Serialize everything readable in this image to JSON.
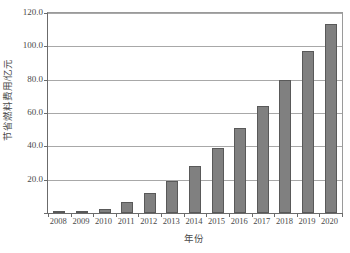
{
  "chart_data": {
    "type": "bar",
    "title": "",
    "xlabel": "年份",
    "ylabel": "节省燃料费用/亿元",
    "categories": [
      "2008",
      "2009",
      "2010",
      "2011",
      "2012",
      "2013",
      "2014",
      "2015",
      "2016",
      "2017",
      "2018",
      "2019",
      "2020"
    ],
    "values": [
      0.2,
      0.6,
      2.5,
      6.5,
      12.0,
      19.0,
      28.0,
      38.8,
      51.0,
      64.0,
      80.0,
      97.0,
      113.5
    ],
    "series": [
      {
        "name": "节省燃料费用",
        "values": [
          0.2,
          0.6,
          2.5,
          6.5,
          12.0,
          19.0,
          28.0,
          38.8,
          51.0,
          64.0,
          80.0,
          97.0,
          113.5
        ]
      }
    ],
    "ylim": [
      0.0,
      120.0
    ],
    "ytick_values": [
      0.0,
      20.0,
      40.0,
      60.0,
      80.0,
      100.0,
      120.0
    ],
    "ytick_labels": [
      "0.0",
      "20.0",
      "40.0",
      "60.0",
      "80.0",
      "100.0",
      "120.0"
    ],
    "ytick_labels_visible": [
      "20.0",
      "40.0",
      "60.0",
      "80.0",
      "100.0",
      "120.0"
    ],
    "grid": true,
    "grid_axis": "y",
    "legend": false,
    "legend_position": "none",
    "bar_color": "#808080",
    "bar_edge_color": "#595959",
    "grid_color": "#a8a8a8",
    "axis_color": "#6b6b6b",
    "background": "#ffffff"
  }
}
